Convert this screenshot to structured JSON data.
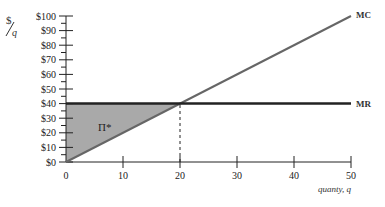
{
  "chart_data": {
    "type": "line",
    "title": "",
    "xlabel": "quanty, q",
    "ylabel": "$/q",
    "xlim": [
      0,
      50
    ],
    "ylim": [
      0,
      100
    ],
    "x_ticks": [
      0,
      10,
      20,
      30,
      40,
      50
    ],
    "y_ticks": [
      "$0",
      "$10",
      "$20",
      "$30",
      "$40",
      "$50",
      "$60",
      "$70",
      "$80",
      "$90",
      "$100"
    ],
    "grid": false,
    "series": [
      {
        "name": "MC",
        "x": [
          0,
          50
        ],
        "y": [
          0,
          100
        ],
        "color": "#666666"
      },
      {
        "name": "MR",
        "x": [
          0,
          50
        ],
        "y": [
          40,
          40
        ],
        "color": "#222222"
      }
    ],
    "annotations": [
      {
        "type": "shaded_region",
        "label": "Π*",
        "vertices": [
          [
            0,
            0
          ],
          [
            0,
            40
          ],
          [
            20,
            40
          ]
        ],
        "color": "#a9a9a9"
      },
      {
        "type": "dashed_line",
        "from": [
          20,
          0
        ],
        "to": [
          20,
          40
        ]
      }
    ]
  },
  "labels": {
    "y_unit_num": "$",
    "y_unit_den": "q",
    "mc": "MC",
    "mr": "MR",
    "profit": "Π*",
    "x_title": "quanty, q"
  }
}
